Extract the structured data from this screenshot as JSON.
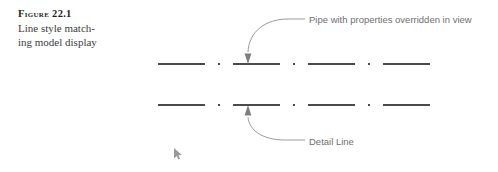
{
  "figure": {
    "number_label": "Figure 22.1",
    "caption_line_1": "Line style match-",
    "caption_line_2": "ing model display"
  },
  "annotations": {
    "pipe_label": "Pipe with properties overridden in view",
    "detail_label": "Detail Line"
  },
  "icons": {
    "cursor": "mouse-cursor-icon",
    "arrowhead_top": "arrowhead-down-icon",
    "arrowhead_bottom": "arrowhead-up-icon"
  },
  "colors": {
    "line_stroke": "#4a4a4c",
    "leader_stroke": "#8d8d8f",
    "label_text": "#6f6f71",
    "caption_text": "#3b3a3c",
    "figure_number_text": "#231f20",
    "background": "#ffffff",
    "cursor": "#9a9a9c"
  },
  "geometry": {
    "canvas_width": 498,
    "canvas_height": 172,
    "top_line_y": 64,
    "bottom_line_y": 105,
    "line_start_x": 158,
    "line_end_x": 443,
    "top_arrow_x": 247,
    "bottom_arrow_x": 247,
    "cursor_x": 178,
    "cursor_y": 150,
    "linestyle": "dash-dot",
    "dash_pattern": "47 13 2 13"
  }
}
